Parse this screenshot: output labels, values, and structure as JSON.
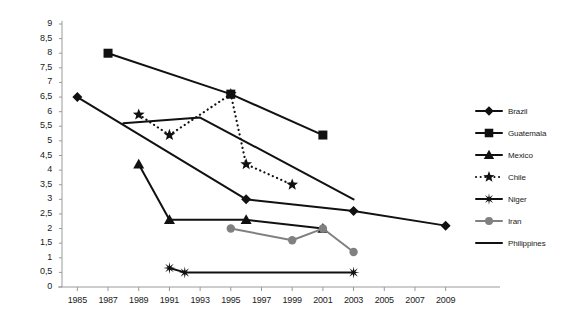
{
  "chart_data": {
    "type": "line",
    "title": "",
    "xlabel": "",
    "ylabel": "",
    "xlim": [
      1984,
      2010
    ],
    "ylim": [
      0,
      9
    ],
    "grid": false,
    "legend_position": "right",
    "x_ticks": [
      "1985",
      "1987",
      "1989",
      "1991",
      "1993",
      "1995",
      "1997",
      "1999",
      "2001",
      "2003",
      "2005",
      "2007",
      "2009"
    ],
    "y_ticks": [
      "0",
      "0,5",
      "1",
      "1,5",
      "2",
      "2,5",
      "3",
      "3,5",
      "4",
      "4,5",
      "5",
      "5,5",
      "6",
      "6,5",
      "7",
      "7,5",
      "8",
      "8,5",
      "9"
    ],
    "series": [
      {
        "name": "Brazil",
        "marker": "diamond",
        "line": "solid",
        "color": "#111111",
        "points": [
          {
            "x": 1985,
            "y": 6.5
          },
          {
            "x": 1996,
            "y": 3.0
          },
          {
            "x": 2003,
            "y": 2.6
          },
          {
            "x": 2009,
            "y": 2.1
          }
        ]
      },
      {
        "name": "Guatemala",
        "marker": "square",
        "line": "solid",
        "color": "#111111",
        "points": [
          {
            "x": 1987,
            "y": 8.0
          },
          {
            "x": 1995,
            "y": 6.6
          },
          {
            "x": 2001,
            "y": 5.2
          }
        ]
      },
      {
        "name": "Mexico",
        "marker": "triangle",
        "line": "solid",
        "color": "#111111",
        "points": [
          {
            "x": 1989,
            "y": 4.2
          },
          {
            "x": 1991,
            "y": 2.3
          },
          {
            "x": 1996,
            "y": 2.3
          },
          {
            "x": 2001,
            "y": 2.0
          }
        ]
      },
      {
        "name": "Chile",
        "marker": "star",
        "line": "dotted",
        "color": "#111111",
        "points": [
          {
            "x": 1989,
            "y": 5.9
          },
          {
            "x": 1991,
            "y": 5.2
          },
          {
            "x": 1995,
            "y": 6.6
          },
          {
            "x": 1996,
            "y": 4.2
          },
          {
            "x": 1999,
            "y": 3.5
          }
        ]
      },
      {
        "name": "Niger",
        "marker": "asterisk",
        "line": "solid",
        "color": "#111111",
        "points": [
          {
            "x": 1991,
            "y": 0.65
          },
          {
            "x": 1992,
            "y": 0.5
          },
          {
            "x": 2003,
            "y": 0.5
          }
        ]
      },
      {
        "name": "Iran",
        "marker": "circle",
        "line": "solid",
        "color": "#808080",
        "points": [
          {
            "x": 1995,
            "y": 2.0
          },
          {
            "x": 1999,
            "y": 1.6
          },
          {
            "x": 2001,
            "y": 2.0
          },
          {
            "x": 2003,
            "y": 1.2
          }
        ]
      },
      {
        "name": "Philippines",
        "marker": "none",
        "line": "solid",
        "color": "#111111",
        "points": [
          {
            "x": 1988,
            "y": 5.6
          },
          {
            "x": 1993,
            "y": 5.8
          },
          {
            "x": 2003,
            "y": 3.0
          }
        ]
      }
    ]
  },
  "axes": {
    "axis_color": "#9a9a9a",
    "tick_color": "#9a9a9a",
    "label_color": "#1a1a1a"
  },
  "legend": {
    "entries": [
      {
        "label": "Brazil"
      },
      {
        "label": "Guatemala"
      },
      {
        "label": "Mexico"
      },
      {
        "label": "Chile"
      },
      {
        "label": "Niger"
      },
      {
        "label": "Iran"
      },
      {
        "label": "Philippines"
      }
    ]
  }
}
